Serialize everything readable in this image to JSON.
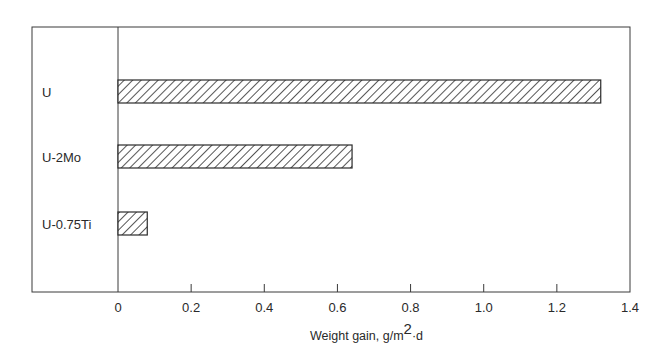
{
  "chart_data": {
    "type": "bar",
    "orientation": "horizontal",
    "title": "",
    "categories": [
      "U",
      "U-2Mo",
      "U-0.75Ti"
    ],
    "values": [
      1.32,
      0.64,
      0.08
    ],
    "xlabel": "Weight gain, g/m",
    "xlabel_superscript": "2",
    "xlabel_suffix": "·d",
    "ylabel": "",
    "xlim": [
      0,
      1.4
    ],
    "xticks": [
      0,
      0.2,
      0.4,
      0.6,
      0.8,
      1.0,
      1.2,
      1.4
    ],
    "xtick_labels": [
      "0",
      "0.2",
      "0.4",
      "0.6",
      "0.8",
      "1.0",
      "1.2",
      "1.4"
    ],
    "grid": false,
    "bar_fill": "diagonal-hatch",
    "colors": {
      "line": "#2a2a2a",
      "background": "#ffffff"
    }
  }
}
